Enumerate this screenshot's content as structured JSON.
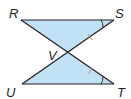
{
  "diagram": {
    "type": "geometry-figure",
    "colors": {
      "fill": "#bfe0f5",
      "stroke": "#231f20",
      "tick": "#e0836a",
      "arc": "#231f20"
    },
    "points": {
      "R": {
        "label": "R",
        "x": 21,
        "y": 20
      },
      "S": {
        "label": "S",
        "x": 114,
        "y": 20
      },
      "V": {
        "label": "V",
        "x": 68,
        "y": 52
      },
      "U": {
        "label": "U",
        "x": 22,
        "y": 84
      },
      "T": {
        "label": "T",
        "x": 114,
        "y": 84
      }
    },
    "segments": [
      "RS",
      "UT",
      "RT",
      "SU"
    ],
    "markings": {
      "congruent_segments": [
        "SV",
        "TV"
      ],
      "congruent_angles": [
        "S",
        "T"
      ]
    }
  }
}
